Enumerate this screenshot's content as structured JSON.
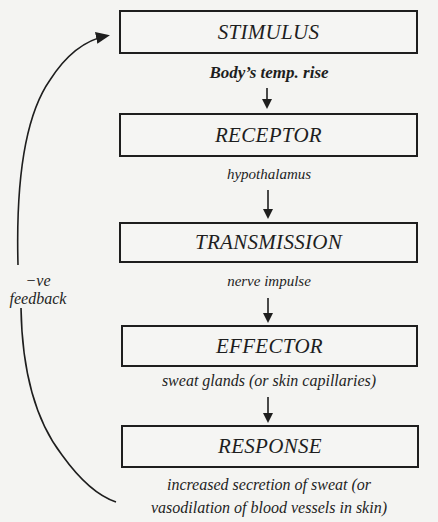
{
  "diagram": {
    "type": "negative-feedback-flowchart",
    "boxes": [
      {
        "id": "stimulus",
        "label": "STIMULUS"
      },
      {
        "id": "receptor",
        "label": "RECEPTOR"
      },
      {
        "id": "transmission",
        "label": "TRANSMISSION"
      },
      {
        "id": "effector",
        "label": "EFFECTOR"
      },
      {
        "id": "response",
        "label": "RESPONSE"
      }
    ],
    "connectors": [
      {
        "from": "stimulus",
        "to": "receptor",
        "label": "Body’s temp. rise"
      },
      {
        "from": "receptor",
        "to": "transmission",
        "label": "hypothalamus"
      },
      {
        "from": "transmission",
        "to": "effector",
        "label": "nerve impulse"
      },
      {
        "from": "effector",
        "to": "response",
        "label": "sweat glands (or skin capillaries)"
      }
    ],
    "response_detail": {
      "line1": "increased secretion of sweat (or",
      "line2": "vasodilation of blood vessels in skin)"
    },
    "feedback": {
      "from": "response",
      "to": "stimulus",
      "label_line1": "−ve",
      "label_line2": "feedback"
    },
    "colors": {
      "ink": "#1e1e1e",
      "background": "#f4f4f2"
    }
  }
}
